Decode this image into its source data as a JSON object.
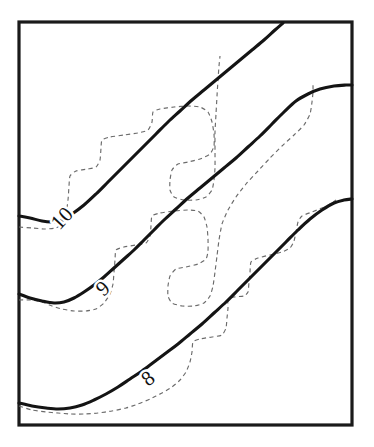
{
  "figure": {
    "type": "contour-diagram",
    "background_color": "#ffffff",
    "frame": {
      "name": "plot-border",
      "x": 19,
      "y": 22,
      "width": 333,
      "height": 403,
      "stroke_color": "#1a1a1a",
      "stroke_width": 3.2
    },
    "legend_note": "",
    "title": "",
    "xlabel": "",
    "ylabel": ""
  },
  "chart_data": {
    "type": "line",
    "title": "",
    "xlabel": "",
    "ylabel": "",
    "grid": false,
    "legend_position": "none",
    "axis_ranges": {
      "x": [
        19,
        352
      ],
      "y": [
        22,
        425
      ]
    },
    "annotations": [
      {
        "text": "10",
        "x": 62,
        "y": 218,
        "rotation": -47
      },
      {
        "text": "9",
        "x": 103,
        "y": 288,
        "rotation": -42
      },
      {
        "text": "8",
        "x": 148,
        "y": 378,
        "rotation": -38
      }
    ],
    "series": [
      {
        "name": "contour-10-solid",
        "label": "10",
        "style": "solid",
        "color": "#141414",
        "points": [
          [
            19,
            216
          ],
          [
            30,
            218
          ],
          [
            42,
            221
          ],
          [
            52,
            222
          ],
          [
            62,
            220
          ],
          [
            72,
            214
          ],
          [
            84,
            205
          ],
          [
            96,
            194
          ],
          [
            108,
            182
          ],
          [
            120,
            170
          ],
          [
            132,
            158
          ],
          [
            144,
            146
          ],
          [
            156,
            134
          ],
          [
            168,
            122
          ],
          [
            180,
            111
          ],
          [
            192,
            100
          ],
          [
            204,
            90
          ],
          [
            216,
            80
          ],
          [
            228,
            70
          ],
          [
            240,
            60
          ],
          [
            252,
            50
          ],
          [
            264,
            40
          ],
          [
            275,
            30
          ],
          [
            283,
            23
          ]
        ]
      },
      {
        "name": "contour-10-dashed",
        "label": "10-staircase",
        "style": "dashed",
        "color": "#6b6b6b",
        "points": [
          [
            19,
            227
          ],
          [
            32,
            228
          ],
          [
            45,
            229
          ],
          [
            56,
            228
          ],
          [
            62,
            224
          ],
          [
            66,
            214
          ],
          [
            68,
            200
          ],
          [
            69,
            186
          ],
          [
            70,
            176
          ],
          [
            76,
            171
          ],
          [
            88,
            169
          ],
          [
            96,
            167
          ],
          [
            100,
            160
          ],
          [
            101,
            148
          ],
          [
            102,
            140
          ],
          [
            110,
            137
          ],
          [
            124,
            135
          ],
          [
            138,
            133
          ],
          [
            148,
            130
          ],
          [
            152,
            122
          ],
          [
            153,
            112
          ],
          [
            160,
            109
          ],
          [
            174,
            107
          ],
          [
            188,
            106
          ],
          [
            200,
            107
          ],
          [
            208,
            112
          ],
          [
            212,
            122
          ],
          [
            214,
            134
          ],
          [
            214,
            146
          ],
          [
            210,
            154
          ],
          [
            200,
            159
          ],
          [
            188,
            162
          ],
          [
            178,
            164
          ],
          [
            172,
            170
          ],
          [
            170,
            180
          ],
          [
            170,
            190
          ],
          [
            174,
            197
          ],
          [
            184,
            200
          ],
          [
            196,
            200
          ],
          [
            206,
            197
          ],
          [
            212,
            190
          ],
          [
            214,
            180
          ],
          [
            215,
            168
          ],
          [
            215,
            150
          ],
          [
            215,
            132
          ],
          [
            216,
            114
          ],
          [
            217,
            96
          ],
          [
            218,
            80
          ],
          [
            219,
            66
          ],
          [
            220,
            56
          ]
        ]
      },
      {
        "name": "contour-9-solid",
        "label": "9",
        "style": "solid",
        "color": "#141414",
        "points": [
          [
            19,
            294
          ],
          [
            30,
            298
          ],
          [
            42,
            301
          ],
          [
            54,
            303
          ],
          [
            64,
            302
          ],
          [
            74,
            298
          ],
          [
            84,
            292
          ],
          [
            94,
            285
          ],
          [
            104,
            277
          ],
          [
            114,
            268
          ],
          [
            124,
            259
          ],
          [
            134,
            250
          ],
          [
            144,
            240
          ],
          [
            154,
            230
          ],
          [
            164,
            220
          ],
          [
            176,
            209
          ],
          [
            188,
            198
          ],
          [
            200,
            188
          ],
          [
            212,
            178
          ],
          [
            224,
            168
          ],
          [
            236,
            158
          ],
          [
            248,
            147
          ],
          [
            260,
            136
          ],
          [
            272,
            124
          ],
          [
            284,
            112
          ],
          [
            296,
            101
          ],
          [
            308,
            94
          ],
          [
            320,
            89
          ],
          [
            334,
            86
          ],
          [
            346,
            85
          ],
          [
            352,
            85
          ]
        ]
      },
      {
        "name": "contour-9-dashed",
        "label": "9-staircase",
        "style": "dashed",
        "color": "#6b6b6b",
        "points": [
          [
            19,
            300
          ],
          [
            30,
            300
          ],
          [
            42,
            302
          ],
          [
            52,
            306
          ],
          [
            62,
            309
          ],
          [
            74,
            311
          ],
          [
            86,
            311
          ],
          [
            96,
            309
          ],
          [
            104,
            303
          ],
          [
            110,
            294
          ],
          [
            113,
            284
          ],
          [
            114,
            272
          ],
          [
            115,
            260
          ],
          [
            116,
            250
          ],
          [
            124,
            247
          ],
          [
            136,
            245
          ],
          [
            146,
            243
          ],
          [
            150,
            236
          ],
          [
            151,
            226
          ],
          [
            152,
            216
          ],
          [
            160,
            213
          ],
          [
            174,
            211
          ],
          [
            188,
            210
          ],
          [
            198,
            211
          ],
          [
            204,
            217
          ],
          [
            207,
            227
          ],
          [
            208,
            239
          ],
          [
            208,
            251
          ],
          [
            206,
            259
          ],
          [
            198,
            264
          ],
          [
            186,
            267
          ],
          [
            176,
            269
          ],
          [
            170,
            276
          ],
          [
            168,
            286
          ],
          [
            168,
            296
          ],
          [
            172,
            303
          ],
          [
            182,
            306
          ],
          [
            194,
            306
          ],
          [
            204,
            303
          ],
          [
            210,
            296
          ],
          [
            213,
            286
          ],
          [
            215,
            272
          ],
          [
            217,
            256
          ],
          [
            219,
            240
          ],
          [
            222,
            224
          ],
          [
            228,
            210
          ],
          [
            236,
            197
          ],
          [
            246,
            184
          ],
          [
            258,
            171
          ],
          [
            270,
            158
          ],
          [
            282,
            146
          ],
          [
            294,
            135
          ],
          [
            304,
            125
          ],
          [
            310,
            114
          ],
          [
            312,
            102
          ],
          [
            313,
            92
          ],
          [
            313,
            84
          ]
        ]
      },
      {
        "name": "contour-8-solid",
        "label": "8",
        "style": "solid",
        "color": "#141414",
        "points": [
          [
            19,
            403
          ],
          [
            32,
            406
          ],
          [
            46,
            408
          ],
          [
            58,
            409
          ],
          [
            70,
            408
          ],
          [
            82,
            405
          ],
          [
            94,
            400
          ],
          [
            106,
            394
          ],
          [
            118,
            387
          ],
          [
            130,
            379
          ],
          [
            142,
            371
          ],
          [
            154,
            362
          ],
          [
            166,
            353
          ],
          [
            178,
            344
          ],
          [
            190,
            334
          ],
          [
            202,
            324
          ],
          [
            214,
            313
          ],
          [
            226,
            302
          ],
          [
            238,
            290
          ],
          [
            250,
            278
          ],
          [
            262,
            266
          ],
          [
            274,
            254
          ],
          [
            286,
            242
          ],
          [
            298,
            230
          ],
          [
            310,
            219
          ],
          [
            322,
            210
          ],
          [
            334,
            203
          ],
          [
            344,
            200
          ],
          [
            352,
            199
          ]
        ]
      },
      {
        "name": "contour-8-dashed",
        "label": "8-staircase",
        "style": "dashed",
        "color": "#6b6b6b",
        "points": [
          [
            19,
            406
          ],
          [
            32,
            410
          ],
          [
            46,
            412
          ],
          [
            58,
            413
          ],
          [
            70,
            414
          ],
          [
            84,
            414
          ],
          [
            98,
            413
          ],
          [
            112,
            411
          ],
          [
            126,
            408
          ],
          [
            138,
            404
          ],
          [
            150,
            399
          ],
          [
            162,
            393
          ],
          [
            172,
            387
          ],
          [
            180,
            380
          ],
          [
            186,
            372
          ],
          [
            190,
            362
          ],
          [
            192,
            352
          ],
          [
            193,
            342
          ],
          [
            200,
            339
          ],
          [
            212,
            337
          ],
          [
            222,
            335
          ],
          [
            226,
            328
          ],
          [
            227,
            318
          ],
          [
            228,
            308
          ],
          [
            228,
            300
          ],
          [
            234,
            297
          ],
          [
            244,
            296
          ],
          [
            248,
            292
          ],
          [
            249,
            282
          ],
          [
            250,
            272
          ],
          [
            251,
            262
          ],
          [
            258,
            258
          ],
          [
            270,
            255
          ],
          [
            282,
            252
          ],
          [
            290,
            248
          ],
          [
            294,
            241
          ],
          [
            296,
            232
          ],
          [
            298,
            222
          ],
          [
            302,
            216
          ],
          [
            312,
            212
          ],
          [
            322,
            208
          ],
          [
            330,
            204
          ],
          [
            336,
            200
          ]
        ]
      }
    ]
  }
}
